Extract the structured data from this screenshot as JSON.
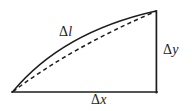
{
  "figure": {
    "kind": "geometry-diagram",
    "background_color": "#ffffff",
    "ink_color": "#1d1d1d",
    "width": 192,
    "height": 111,
    "labels": {
      "arc_length": {
        "delta": "Δ",
        "symbol": "l",
        "full": "Δl"
      },
      "vertical_leg": {
        "delta": "Δ",
        "symbol": "y",
        "full": "Δy"
      },
      "horizontal_leg": {
        "delta": "Δ",
        "symbol": "x",
        "full": "Δx"
      }
    },
    "geometry": {
      "apex_left": [
        12,
        92
      ],
      "corner_top_right": [
        156,
        11
      ],
      "corner_bottom_right": [
        156,
        92
      ],
      "arc_control": [
        60,
        36
      ],
      "chord_style": "dashed",
      "arc_style": "solid",
      "leg_style": "solid"
    }
  }
}
